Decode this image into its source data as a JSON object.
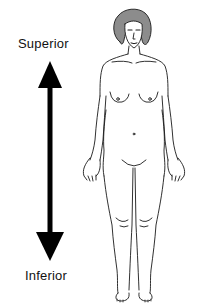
{
  "diagram": {
    "labels": {
      "top": "Superior",
      "bottom": "Inferior"
    },
    "arrow": {
      "type": "double-headed vertical",
      "color": "#000000"
    },
    "figure": {
      "description": "Front-view line drawing of standing female figure in anatomical position",
      "hair_color": "#8c8c8c",
      "line_color": "#1a1a1a"
    }
  }
}
